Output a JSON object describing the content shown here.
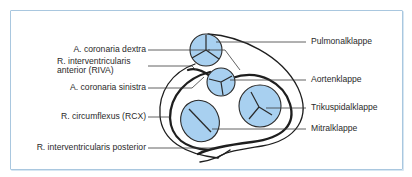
{
  "figure": {
    "type": "heart valve plane with coronary arteries (top view)",
    "colors": {
      "frame_border": "#a9c7df",
      "valve_fill": "#a8d0f0",
      "line": "#1e1e1e",
      "text": "#2a2a2a"
    }
  },
  "labels_left": [
    {
      "id": "a-coronaria-dextra",
      "text": "A. coronaria dextra"
    },
    {
      "id": "riva-line1",
      "text": "R. interventricularis"
    },
    {
      "id": "riva-line2",
      "text": "anterior (RIVA)"
    },
    {
      "id": "a-coronaria-sinistra",
      "text": "A. coronaria sinistra"
    },
    {
      "id": "rcx",
      "text": "R. circumflexus (RCX)"
    },
    {
      "id": "riv-posterior",
      "text": "R. interventricularis posterior"
    }
  ],
  "labels_right": [
    {
      "id": "pulmonalklappe",
      "text": "Pulmonalklappe"
    },
    {
      "id": "aortenklappe",
      "text": "Aortenklappe"
    },
    {
      "id": "trikuspidalklappe",
      "text": "Trikuspidalklappe"
    },
    {
      "id": "mitralklappe",
      "text": "Mitralklappe"
    }
  ],
  "valves": [
    {
      "name": "Pulmonalklappe",
      "cusps": 3
    },
    {
      "name": "Aortenklappe",
      "cusps": 3
    },
    {
      "name": "Trikuspidalklappe",
      "cusps": 3
    },
    {
      "name": "Mitralklappe",
      "cusps": 2
    }
  ]
}
